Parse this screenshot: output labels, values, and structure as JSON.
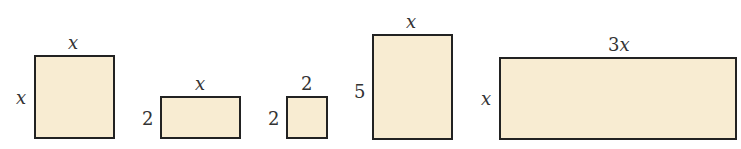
{
  "figure": {
    "fill_color": "#f8ecd2",
    "stroke_color": "#222222",
    "shapes": [
      {
        "name": "square-x-by-x",
        "top_label": "x",
        "side_label": "x"
      },
      {
        "name": "rect-x-by-2",
        "top_label": "x",
        "side_label": "2"
      },
      {
        "name": "square-2-by-2",
        "top_label": "2",
        "side_label": "2"
      },
      {
        "name": "rect-x-by-5",
        "top_label": "x",
        "side_label": "5"
      },
      {
        "name": "rect-3x-by-x",
        "top_label": "3x",
        "side_label": "x"
      }
    ]
  }
}
